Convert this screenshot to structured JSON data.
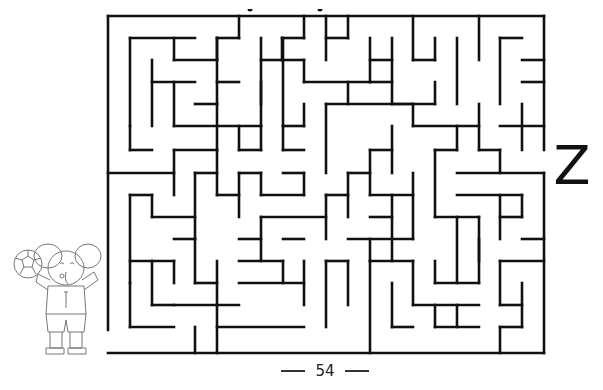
{
  "page": {
    "page_number": "54",
    "goal_letter": "Z",
    "mascot": "elephant-with-soccer-ball"
  },
  "maze": {
    "stroke_color": "#111111",
    "stroke_width": 2.6,
    "frame": {
      "left": 108,
      "top": 16,
      "right": 544,
      "bottom": 353
    },
    "entrance": {
      "side": "left",
      "y_from": 330,
      "y_to": 353
    },
    "exit": {
      "side": "right",
      "y_from": 150,
      "y_to": 173
    },
    "segments": [
      [
        108,
        16,
        544,
        16
      ],
      [
        108,
        16,
        108,
        330
      ],
      [
        108,
        353,
        544,
        353
      ],
      [
        544,
        16,
        544,
        150
      ],
      [
        544,
        173,
        544,
        353
      ],
      [
        130,
        38,
        195,
        38
      ],
      [
        130,
        38,
        130,
        126
      ],
      [
        174,
        38,
        174,
        60
      ],
      [
        174,
        60,
        217,
        60
      ],
      [
        217,
        38,
        217,
        60
      ],
      [
        217,
        38,
        239,
        38
      ],
      [
        239,
        16,
        239,
        38
      ],
      [
        152,
        60,
        152,
        126
      ],
      [
        152,
        82,
        195,
        82
      ],
      [
        174,
        82,
        174,
        126
      ],
      [
        195,
        104,
        217,
        104
      ],
      [
        217,
        38,
        217,
        104
      ],
      [
        261,
        38,
        261,
        104
      ],
      [
        261,
        60,
        283,
        60
      ],
      [
        283,
        38,
        283,
        126
      ],
      [
        304,
        16,
        304,
        38
      ],
      [
        282,
        38,
        304,
        38
      ],
      [
        282,
        38,
        282,
        60
      ],
      [
        282,
        60,
        304,
        60
      ],
      [
        304,
        60,
        304,
        82
      ],
      [
        326,
        16,
        326,
        60
      ],
      [
        326,
        38,
        348,
        38
      ],
      [
        348,
        16,
        348,
        38
      ],
      [
        370,
        38,
        370,
        82
      ],
      [
        370,
        60,
        392,
        60
      ],
      [
        392,
        38,
        392,
        104
      ],
      [
        370,
        82,
        392,
        82
      ],
      [
        413,
        16,
        413,
        60
      ],
      [
        435,
        38,
        435,
        60
      ],
      [
        413,
        60,
        435,
        60
      ],
      [
        457,
        38,
        457,
        104
      ],
      [
        479,
        16,
        479,
        60
      ],
      [
        500,
        38,
        522,
        38
      ],
      [
        500,
        38,
        500,
        104
      ],
      [
        522,
        60,
        544,
        60
      ],
      [
        304,
        82,
        370,
        82
      ],
      [
        261,
        82,
        261,
        126
      ],
      [
        283,
        126,
        304,
        126
      ],
      [
        304,
        104,
        304,
        126
      ],
      [
        217,
        82,
        239,
        82
      ],
      [
        174,
        126,
        261,
        126
      ],
      [
        108,
        173,
        174,
        173
      ],
      [
        130,
        126,
        130,
        150
      ],
      [
        130,
        150,
        152,
        150
      ],
      [
        174,
        150,
        174,
        195
      ],
      [
        174,
        150,
        217,
        150
      ],
      [
        217,
        104,
        217,
        150
      ],
      [
        239,
        126,
        239,
        150
      ],
      [
        239,
        150,
        261,
        150
      ],
      [
        261,
        126,
        261,
        150
      ],
      [
        283,
        126,
        283,
        150
      ],
      [
        283,
        150,
        304,
        150
      ],
      [
        326,
        104,
        326,
        173
      ],
      [
        326,
        104,
        413,
        104
      ],
      [
        348,
        82,
        348,
        104
      ],
      [
        392,
        104,
        435,
        104
      ],
      [
        435,
        82,
        435,
        104
      ],
      [
        413,
        104,
        413,
        126
      ],
      [
        413,
        126,
        479,
        126
      ],
      [
        457,
        126,
        457,
        150
      ],
      [
        479,
        104,
        479,
        150
      ],
      [
        392,
        126,
        392,
        173
      ],
      [
        370,
        150,
        392,
        150
      ],
      [
        370,
        150,
        370,
        195
      ],
      [
        348,
        173,
        370,
        173
      ],
      [
        435,
        150,
        435,
        217
      ],
      [
        435,
        150,
        457,
        150
      ],
      [
        479,
        150,
        500,
        150
      ],
      [
        500,
        150,
        500,
        173
      ],
      [
        457,
        173,
        544,
        173
      ],
      [
        457,
        195,
        522,
        195
      ],
      [
        522,
        195,
        522,
        217
      ],
      [
        522,
        82,
        544,
        82
      ],
      [
        522,
        104,
        522,
        150
      ],
      [
        500,
        126,
        544,
        126
      ],
      [
        130,
        195,
        152,
        195
      ],
      [
        130,
        195,
        130,
        283
      ],
      [
        152,
        195,
        152,
        217
      ],
      [
        152,
        217,
        195,
        217
      ],
      [
        195,
        173,
        195,
        239
      ],
      [
        195,
        173,
        217,
        173
      ],
      [
        217,
        150,
        217,
        195
      ],
      [
        174,
        239,
        195,
        239
      ],
      [
        217,
        195,
        239,
        195
      ],
      [
        239,
        173,
        239,
        217
      ],
      [
        239,
        173,
        261,
        173
      ],
      [
        261,
        173,
        261,
        195
      ],
      [
        261,
        195,
        304,
        195
      ],
      [
        304,
        173,
        304,
        195
      ],
      [
        283,
        173,
        304,
        173
      ],
      [
        326,
        195,
        348,
        195
      ],
      [
        326,
        195,
        326,
        239
      ],
      [
        348,
        173,
        348,
        217
      ],
      [
        261,
        217,
        326,
        217
      ],
      [
        261,
        217,
        261,
        261
      ],
      [
        239,
        239,
        261,
        239
      ],
      [
        283,
        239,
        304,
        239
      ],
      [
        370,
        195,
        413,
        195
      ],
      [
        413,
        173,
        413,
        239
      ],
      [
        392,
        195,
        392,
        261
      ],
      [
        370,
        217,
        392,
        217
      ],
      [
        348,
        239,
        413,
        239
      ],
      [
        370,
        239,
        370,
        261
      ],
      [
        435,
        217,
        479,
        217
      ],
      [
        457,
        217,
        457,
        283
      ],
      [
        479,
        217,
        479,
        261
      ],
      [
        500,
        217,
        522,
        217
      ],
      [
        500,
        195,
        500,
        239
      ],
      [
        522,
        239,
        544,
        239
      ],
      [
        130,
        261,
        174,
        261
      ],
      [
        152,
        261,
        152,
        305
      ],
      [
        174,
        261,
        174,
        283
      ],
      [
        152,
        305,
        174,
        305
      ],
      [
        195,
        239,
        195,
        283
      ],
      [
        195,
        283,
        217,
        283
      ],
      [
        217,
        261,
        217,
        305
      ],
      [
        239,
        261,
        283,
        261
      ],
      [
        130,
        283,
        130,
        327
      ],
      [
        130,
        327,
        174,
        327
      ],
      [
        174,
        305,
        239,
        305
      ],
      [
        195,
        327,
        195,
        353
      ],
      [
        217,
        305,
        217,
        353
      ],
      [
        217,
        327,
        304,
        327
      ],
      [
        239,
        283,
        304,
        283
      ],
      [
        283,
        261,
        283,
        283
      ],
      [
        304,
        261,
        304,
        305
      ],
      [
        326,
        261,
        326,
        327
      ],
      [
        326,
        261,
        348,
        261
      ],
      [
        348,
        261,
        348,
        305
      ],
      [
        370,
        261,
        370,
        353
      ],
      [
        370,
        261,
        413,
        261
      ],
      [
        392,
        283,
        392,
        327
      ],
      [
        413,
        261,
        413,
        305
      ],
      [
        413,
        305,
        479,
        305
      ],
      [
        435,
        261,
        435,
        283
      ],
      [
        435,
        283,
        479,
        283
      ],
      [
        479,
        239,
        479,
        283
      ],
      [
        392,
        327,
        413,
        327
      ],
      [
        435,
        327,
        479,
        327
      ],
      [
        457,
        305,
        457,
        327
      ],
      [
        500,
        261,
        500,
        305
      ],
      [
        500,
        261,
        544,
        261
      ],
      [
        500,
        305,
        522,
        305
      ],
      [
        522,
        283,
        522,
        327
      ],
      [
        500,
        327,
        522,
        327
      ],
      [
        500,
        327,
        500,
        353
      ],
      [
        435,
        305,
        435,
        327
      ]
    ]
  }
}
